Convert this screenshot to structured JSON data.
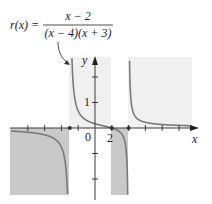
{
  "formula": {
    "lhs": "r(x) =",
    "numerator": "x − 2",
    "denominator": "(x − 4)(x + 3)"
  },
  "axes": {
    "x_label": "x",
    "y_label": "y",
    "origin_label": "0",
    "x_tick_label": "2",
    "y_tick_label": "1"
  },
  "colors": {
    "curve": "#7a7a7a",
    "axis": "#3a3a3a",
    "light_region": "#f0f0f0",
    "dark_region": "#c8c8c8",
    "text": "#222222"
  },
  "chart_data": {
    "type": "line",
    "function": "(x-2)/((x-4)*(x+3))",
    "xlabel": "x",
    "ylabel": "y",
    "xlim": [
      -10,
      12
    ],
    "ylim": [
      -2.8,
      2.7
    ],
    "x_tick_step": 2,
    "y_tick_step": 1,
    "labeled_ticks": {
      "x": [
        0,
        2
      ],
      "y": [
        1
      ]
    },
    "vertical_asymptotes": [
      -3,
      4
    ],
    "horizontal_asymptote": 0,
    "x_intercept": 2,
    "marked_points_on_x_axis": [
      -3,
      2,
      4
    ],
    "shaded_regions": [
      {
        "x_from": -10,
        "x_to": -3,
        "sign": "negative",
        "shade": "dark"
      },
      {
        "x_from": -3,
        "x_to": 2,
        "sign": "positive",
        "shade": "light"
      },
      {
        "x_from": 2,
        "x_to": 4,
        "sign": "negative",
        "shade": "dark"
      },
      {
        "x_from": 4,
        "x_to": 11.5,
        "sign": "positive",
        "shade": "light"
      }
    ],
    "annotation": "arrow from formula to left branch of curve",
    "grid": false
  }
}
